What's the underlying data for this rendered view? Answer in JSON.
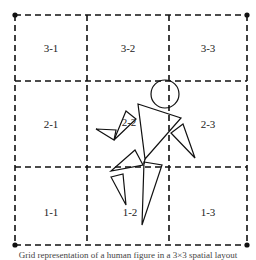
{
  "diagram": {
    "grid": {
      "rows": 3,
      "cols": 3,
      "line_style": "dashed",
      "corner_markers": "filled-dots"
    },
    "cells": [
      {
        "id": "3-1",
        "label": "3-1",
        "x": 51,
        "y": 48
      },
      {
        "id": "3-2",
        "label": "3-2",
        "x": 128,
        "y": 48
      },
      {
        "id": "3-3",
        "label": "3-3",
        "x": 208,
        "y": 48
      },
      {
        "id": "2-1",
        "label": "2-1",
        "x": 51,
        "y": 124
      },
      {
        "id": "2-2",
        "label": "2-2",
        "x": 129,
        "y": 122
      },
      {
        "id": "2-3",
        "label": "2-3",
        "x": 208,
        "y": 124
      },
      {
        "id": "1-1",
        "label": "1-1",
        "x": 51,
        "y": 212
      },
      {
        "id": "1-2",
        "label": "1-2",
        "x": 130,
        "y": 212
      },
      {
        "id": "1-3",
        "label": "1-3",
        "x": 208,
        "y": 212
      }
    ],
    "caption": "Grid representation of a human figure in a 3×3 spatial layout"
  },
  "colors": {
    "stroke": "#111111",
    "text": "#222222",
    "background": "#ffffff"
  }
}
